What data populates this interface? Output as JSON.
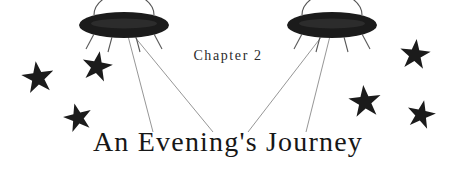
{
  "page": {
    "background_color": "#ffffff",
    "ink_color": "#171717",
    "beam_color": "#8a8a8a",
    "width": 456,
    "height": 170
  },
  "header": {
    "chapter_label": "Chapter 2",
    "title": "An Evening's Journey"
  },
  "decorations": {
    "ufos": [
      {
        "name": "ufo-left",
        "cx": 124,
        "cy": 25,
        "rx": 45,
        "ry": 13
      },
      {
        "name": "ufo-right",
        "cx": 332,
        "cy": 25,
        "rx": 45,
        "ry": 13
      }
    ],
    "stars": [
      {
        "name": "star-left-outer",
        "cx": 38,
        "cy": 78,
        "r": 17,
        "rot": -8
      },
      {
        "name": "star-left-upper",
        "cx": 97,
        "cy": 67,
        "r": 16,
        "rot": 10
      },
      {
        "name": "star-left-lower",
        "cx": 78,
        "cy": 118,
        "r": 15,
        "rot": -14
      },
      {
        "name": "star-right-upper",
        "cx": 415,
        "cy": 55,
        "r": 16,
        "rot": 6
      },
      {
        "name": "star-right-middle",
        "cx": 365,
        "cy": 102,
        "r": 17,
        "rot": -6
      },
      {
        "name": "star-right-outer",
        "cx": 421,
        "cy": 115,
        "r": 15,
        "rot": 12
      }
    ],
    "beams": [
      {
        "name": "beam-left-inner",
        "x1": 134,
        "y1": 36,
        "x2": 213,
        "y2": 132
      },
      {
        "name": "beam-left-outer",
        "x1": 128,
        "y1": 36,
        "x2": 153,
        "y2": 132
      },
      {
        "name": "beam-right-inner",
        "x1": 322,
        "y1": 36,
        "x2": 248,
        "y2": 132
      },
      {
        "name": "beam-right-outer",
        "x1": 330,
        "y1": 36,
        "x2": 306,
        "y2": 132
      }
    ]
  }
}
